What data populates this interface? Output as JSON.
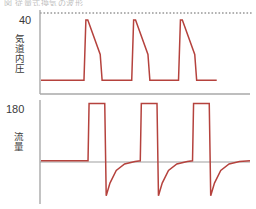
{
  "figure": {
    "cut_header_text": "図 従量式換気の波形",
    "line_color": "#b5423d",
    "axis_color": "#a9a9a9",
    "reference_line_color": "#4a4a4a",
    "background": "#ffffff"
  },
  "panels": [
    {
      "id": "pressure",
      "axis_title": "気道内圧",
      "max_label": "40",
      "reference_value": 40,
      "has_dashed_reference": true
    },
    {
      "id": "flow",
      "axis_title": "流量",
      "max_label": "180",
      "reference_value": 180,
      "has_dashed_reference": false
    }
  ],
  "chart_data": [
    {
      "type": "line",
      "title": "気道内圧",
      "xlabel": "",
      "ylabel": "気道内圧",
      "ylim": [
        0,
        44
      ],
      "xlim": [
        0,
        100
      ],
      "grid": false,
      "legend": "none",
      "annotations": [
        "40"
      ],
      "series": [
        {
          "name": "airway pressure",
          "comment": "three square-ish inspiratory ramps: instant rise to peak 40, slanted decay to ~20, sharp drop to baseline ~5",
          "x": [
            0,
            22.5,
            23.5,
            24.5,
            31,
            32,
            47.5,
            48.5,
            49.5,
            56,
            57,
            72,
            73,
            74,
            80.5,
            81.5,
            92
          ],
          "y": [
            5,
            5,
            40,
            40,
            20,
            5,
            5,
            40,
            40,
            20,
            5,
            5,
            40,
            40,
            20,
            5,
            5
          ]
        }
      ]
    },
    {
      "type": "line",
      "title": "流量",
      "xlabel": "",
      "ylabel": "流量",
      "ylim": [
        -120,
        185
      ],
      "xlim": [
        0,
        100
      ],
      "grid": false,
      "legend": "none",
      "annotations": [
        "180"
      ],
      "series": [
        {
          "name": "flow",
          "comment": "square inspiratory flow pulse to 180, then sharp negative expiratory spike to -110 decaying exponentially back to 0",
          "x": [
            0,
            22.5,
            23.0,
            30.5,
            31.2,
            33,
            36,
            40,
            45,
            47.5,
            48.0,
            55.5,
            56.2,
            58,
            61,
            65,
            70,
            72.5,
            73.0,
            80.5,
            81.2,
            83,
            86,
            90,
            95,
            100
          ],
          "y": [
            0,
            0,
            180,
            180,
            -110,
            -70,
            -30,
            -10,
            -2,
            0,
            180,
            180,
            -110,
            -70,
            -30,
            -10,
            -2,
            0,
            180,
            180,
            -110,
            -70,
            -30,
            -10,
            -2,
            0
          ]
        }
      ]
    }
  ]
}
